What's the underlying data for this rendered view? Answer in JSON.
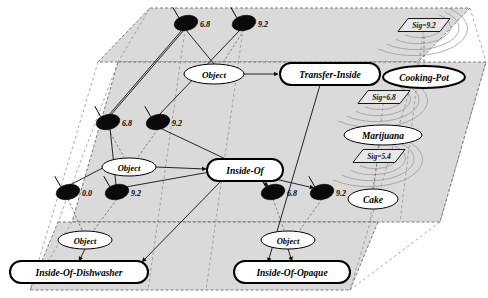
{
  "figure": {
    "background": "#ffffff",
    "plane_fill": "#d9d9d9",
    "plane_stroke": "#555555",
    "node_fill": "#ffffff",
    "node_stroke": "#000000",
    "blob_fill": "#0a0a0a",
    "edge_color": "#1a1a1a"
  },
  "planes": [
    {
      "name": "top-plane",
      "points": "150,8 470,8 418,62 98,62"
    },
    {
      "name": "middle-plane",
      "points": "118,62 486,62 440,222 72,222"
    },
    {
      "name": "bottom-plane",
      "points": "58,222 378,222 350,290 30,290"
    }
  ],
  "nodes": [
    {
      "id": "n-object-top",
      "label": "Object",
      "cx": 214,
      "cy": 74,
      "rx": 30,
      "ry": 10,
      "shape": "ellipse",
      "bold": false,
      "font": 9
    },
    {
      "id": "n-transfer-inside",
      "label": "Transfer-Inside",
      "cx": 330,
      "cy": 74,
      "rx": 50,
      "ry": 11,
      "shape": "roundedrect",
      "bold": true,
      "font": 9.5
    },
    {
      "id": "n-cooking-pot",
      "label": "Cooking-Pot",
      "cx": 424,
      "cy": 77,
      "rx": 41,
      "ry": 11,
      "shape": "ellipse",
      "bold": true,
      "font": 9.5
    },
    {
      "id": "n-marijuana",
      "label": "Marijuana",
      "cx": 383,
      "cy": 135,
      "rx": 39,
      "ry": 10,
      "shape": "ellipse",
      "bold": false,
      "font": 9.5
    },
    {
      "id": "n-object-mid",
      "label": "Object",
      "cx": 129,
      "cy": 167,
      "rx": 27,
      "ry": 9,
      "shape": "ellipse",
      "bold": false,
      "font": 8.5
    },
    {
      "id": "n-inside-of",
      "label": "Inside-Of",
      "cx": 245,
      "cy": 170,
      "rx": 38,
      "ry": 11,
      "shape": "roundedrect",
      "bold": true,
      "font": 9.5
    },
    {
      "id": "n-cake",
      "label": "Cake",
      "cx": 373,
      "cy": 199,
      "rx": 25,
      "ry": 10,
      "shape": "ellipse",
      "bold": false,
      "font": 9.5
    },
    {
      "id": "n-object-bl",
      "label": "Object",
      "cx": 85,
      "cy": 240,
      "rx": 27,
      "ry": 9,
      "shape": "ellipse",
      "bold": false,
      "font": 8.5
    },
    {
      "id": "n-object-br",
      "label": "Object",
      "cx": 288,
      "cy": 240,
      "rx": 27,
      "ry": 9,
      "shape": "ellipse",
      "bold": false,
      "font": 8.5
    },
    {
      "id": "n-inside-of-dishwasher",
      "label": "Inside-Of-Dishwasher",
      "cx": 79,
      "cy": 272,
      "rx": 69,
      "ry": 11,
      "shape": "roundedrect",
      "bold": true,
      "font": 9.5
    },
    {
      "id": "n-inside-of-opaque",
      "label": "Inside-Of-Opaque",
      "cx": 292,
      "cy": 272,
      "rx": 58,
      "ry": 11,
      "shape": "roundedrect",
      "bold": true,
      "font": 9.5
    }
  ],
  "blobs": [
    {
      "id": "b-top-1",
      "cx": 186,
      "cy": 23,
      "rx": 12,
      "ry": 7.5,
      "value": "6.8",
      "lx": 200,
      "ly": 24
    },
    {
      "id": "b-top-2",
      "cx": 244,
      "cy": 23,
      "rx": 12,
      "ry": 7.5,
      "value": "9.2",
      "lx": 258,
      "ly": 24
    },
    {
      "id": "b-mid-1",
      "cx": 108,
      "cy": 122,
      "rx": 12,
      "ry": 7.5,
      "value": "6.8",
      "lx": 122,
      "ly": 123
    },
    {
      "id": "b-mid-2",
      "cx": 158,
      "cy": 122,
      "rx": 12,
      "ry": 7.5,
      "value": "9.2",
      "lx": 172,
      "ly": 123
    },
    {
      "id": "b-low-1",
      "cx": 68,
      "cy": 192,
      "rx": 12,
      "ry": 7.5,
      "value": "0.0",
      "lx": 82,
      "ly": 193
    },
    {
      "id": "b-low-2",
      "cx": 117,
      "cy": 192,
      "rx": 12,
      "ry": 7.5,
      "value": "9.2",
      "lx": 131,
      "ly": 193
    },
    {
      "id": "b-low-3",
      "cx": 273,
      "cy": 192,
      "rx": 12,
      "ry": 7.5,
      "value": "6.8",
      "lx": 287,
      "ly": 193
    },
    {
      "id": "b-low-4",
      "cx": 322,
      "cy": 192,
      "rx": 12,
      "ry": 7.5,
      "value": "9.2",
      "lx": 336,
      "ly": 193
    }
  ],
  "signals": [
    {
      "id": "sig-1",
      "label": "Sig=9.2",
      "cx": 424,
      "cy": 25,
      "w": 42,
      "h": 13
    },
    {
      "id": "sig-2",
      "label": "Sig=6.8",
      "cx": 384,
      "cy": 97,
      "w": 42,
      "h": 13
    },
    {
      "id": "sig-3",
      "label": "Sig=5.4",
      "cx": 379,
      "cy": 156,
      "w": 42,
      "h": 13
    }
  ],
  "edges": [
    {
      "id": "e1",
      "from": "b-top-1",
      "to": "n-object-top",
      "path": "M 186,30 L 214,64",
      "arrow": false,
      "style": "solid"
    },
    {
      "id": "e2",
      "from": "b-top-2",
      "to": "n-object-top",
      "path": "M 244,30 L 222,64",
      "arrow": false,
      "style": "dashed"
    },
    {
      "id": "e3",
      "from": "n-object-top",
      "to": "n-transfer-inside",
      "path": "M 244,74 L 278,74",
      "arrow": true,
      "style": "solid"
    },
    {
      "id": "e4",
      "from": "b-mid-1",
      "to": "n-object-mid",
      "path": "M 108,129 L 124,157",
      "arrow": false,
      "style": "dashed"
    },
    {
      "id": "e5",
      "from": "b-mid-2",
      "to": "n-object-mid",
      "path": "M 158,129 L 138,157",
      "arrow": false,
      "style": "dashed"
    },
    {
      "id": "e6",
      "from": "b-mid-1",
      "to": "b-top-1",
      "path": "M 108,116 L 182,30",
      "arrow": false,
      "style": "solid"
    },
    {
      "id": "e7",
      "from": "b-mid-2",
      "to": "b-top-2",
      "path": "M 158,116 L 240,30",
      "arrow": false,
      "style": "solid"
    },
    {
      "id": "e8",
      "from": "n-object-mid",
      "to": "n-inside-of",
      "path": "M 156,167 L 206,169",
      "arrow": true,
      "style": "solid"
    },
    {
      "id": "e9",
      "from": "n-inside-of",
      "to": "b-low-3",
      "path": "M 258,178 L 268,186",
      "arrow": true,
      "style": "solid"
    },
    {
      "id": "e10",
      "from": "n-inside-of",
      "to": "b-low-4",
      "path": "M 262,176 L 314,188",
      "arrow": true,
      "style": "solid"
    },
    {
      "id": "e11",
      "from": "b-low-1",
      "to": "n-object-bl",
      "path": "M 68,199 L 82,230",
      "arrow": false,
      "style": "dashed"
    },
    {
      "id": "e12",
      "from": "b-low-2",
      "to": "n-object-bl",
      "path": "M 117,199 L 94,230",
      "arrow": false,
      "style": "dashed"
    },
    {
      "id": "e13",
      "from": "b-low-3",
      "to": "n-object-br",
      "path": "M 273,199 L 284,230",
      "arrow": false,
      "style": "dashed"
    },
    {
      "id": "e14",
      "from": "b-low-4",
      "to": "n-object-br",
      "path": "M 322,199 L 300,230",
      "arrow": false,
      "style": "dashed"
    },
    {
      "id": "e15",
      "from": "n-object-bl",
      "to": "n-inside-of-dishwasher",
      "path": "M 85,249 L 79,261",
      "arrow": true,
      "style": "solid"
    },
    {
      "id": "e16",
      "from": "n-object-br",
      "to": "n-inside-of-opaque",
      "path": "M 288,249 L 292,261",
      "arrow": true,
      "style": "solid"
    },
    {
      "id": "e17",
      "from": "n-transfer-inside",
      "to": "n-inside-of-opaque",
      "path": "M 320,85 L 268,262",
      "arrow": true,
      "style": "solid"
    },
    {
      "id": "e18",
      "from": "n-inside-of",
      "to": "n-inside-of-dishwasher",
      "path": "M 224,178 L 142,262",
      "arrow": true,
      "style": "solid"
    },
    {
      "id": "e19",
      "from": "b-low-1",
      "to": "n-object-mid",
      "path": "M 68,186 L 118,160",
      "arrow": false,
      "style": "solid"
    },
    {
      "id": "e20",
      "from": "b-low-2",
      "to": "n-inside-of",
      "path": "M 120,188 L 210,172",
      "arrow": false,
      "style": "solid"
    },
    {
      "id": "e21",
      "from": "b-mid-1",
      "to": "b-low-2",
      "path": "M 110,128 L 116,185",
      "arrow": false,
      "style": "solid"
    },
    {
      "id": "e22",
      "from": "b-mid-2",
      "to": "n-inside-of",
      "path": "M 160,128 L 232,162",
      "arrow": false,
      "style": "solid"
    },
    {
      "id": "e23",
      "from": "b-top-1",
      "to": "b-mid-1",
      "path": "M 184,30 L 110,116",
      "arrow": false,
      "style": "solid"
    },
    {
      "id": "e24",
      "from": "n-cooking-pot",
      "to": "sig-1",
      "path": "M 424,66 L 424,34",
      "arrow": false,
      "style": "dashed"
    },
    {
      "id": "e25",
      "from": "n-marijuana",
      "to": "sig-3",
      "path": "M 379,145 L 379,150",
      "arrow": false,
      "style": "dashed"
    },
    {
      "id": "e26",
      "from": "n-cake",
      "to": "sig-3",
      "path": "M 373,189 L 377,163",
      "arrow": false,
      "style": "dashed"
    }
  ],
  "guides": [
    {
      "id": "g1",
      "path": "M 150,8 L 118,62"
    },
    {
      "id": "g2",
      "path": "M 470,8 L 486,62"
    },
    {
      "id": "g3",
      "path": "M 118,62 L 58,222"
    },
    {
      "id": "g4",
      "path": "M 486,62 L 440,222"
    },
    {
      "id": "g5",
      "path": "M 72,222 L 30,290"
    },
    {
      "id": "g6",
      "path": "M 440,222 L 350,290"
    },
    {
      "id": "g7",
      "path": "M 98,62 L 30,290"
    },
    {
      "id": "g8",
      "path": "M 418,62 L 350,290"
    },
    {
      "id": "g9",
      "path": "M 186,23 L 148,290"
    },
    {
      "id": "g10",
      "path": "M 244,23 L 206,290"
    },
    {
      "id": "g11",
      "path": "M 424,25 L 400,222"
    },
    {
      "id": "g12",
      "path": "M 384,97 L 370,222"
    }
  ]
}
